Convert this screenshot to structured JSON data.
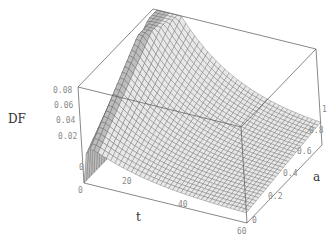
{
  "chart_data": {
    "type": "surface3d",
    "title": "",
    "zlabel": "DF",
    "xlabel": "t",
    "ylabel": "a",
    "x_range": [
      0,
      60
    ],
    "y_range": [
      0,
      1
    ],
    "z_range": [
      0,
      0.08
    ],
    "x_ticks": [
      "0",
      "20",
      "40",
      "60"
    ],
    "y_ticks": [
      "0",
      "0.2",
      "0.4",
      "0.6",
      "0.8",
      "1"
    ],
    "z_ticks": [
      "0",
      "0.02",
      "0.04",
      "0.06",
      "0.08"
    ],
    "grid": false,
    "box": true,
    "surface_description": "DF rises sharply near t≈2-5 with a peak (clipped at 0.08) for large a, then decays smoothly toward ~0.01-0.02 as t increases to 60; for small a the early peak is lower (~0.04).",
    "mesh_resolution": {
      "t": 40,
      "a": 30
    },
    "colors": {
      "mesh_line": "#5a5a5a",
      "surface_fill": "#e8e8e8",
      "box": "#555555",
      "tick": "#8a8a8a"
    }
  },
  "labels": {
    "z_axis": "DF",
    "x_axis": "t",
    "y_axis": "a"
  }
}
